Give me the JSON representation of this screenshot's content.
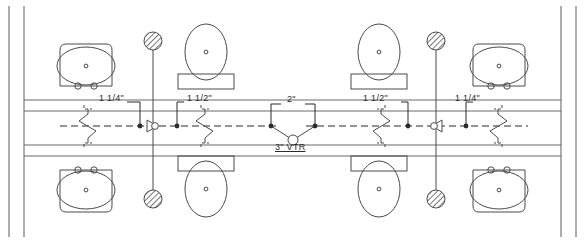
{
  "drawing": {
    "title": "Back-to-Back Restroom Drain, Waste and Vent Plan",
    "type": "plumbing-riser-plan",
    "background_color": "#ffffff",
    "line_color": "#4a4a4a",
    "dark_line_color": "#2b2b2b",
    "hatch_color": "#555555"
  },
  "labels": {
    "lav_left_size": "1 1/4\"",
    "wc_left_size": "1 1/2\"",
    "stack_size": "2\"",
    "vtr": "3\"  VTR",
    "wc_right_size": "1 1/2\"",
    "lav_right_size": "1 1/4\""
  },
  "fixtures": {
    "lavatory_upper_left": {
      "name": "lavatory",
      "position": "upper-left"
    },
    "water_closet_upper_left": {
      "name": "water-closet",
      "position": "upper-left-inner"
    },
    "water_closet_upper_right": {
      "name": "water-closet",
      "position": "upper-right-inner"
    },
    "lavatory_upper_right": {
      "name": "lavatory",
      "position": "upper-right"
    },
    "lavatory_lower_left": {
      "name": "lavatory",
      "position": "lower-left"
    },
    "water_closet_lower_left": {
      "name": "water-closet",
      "position": "lower-left-inner"
    },
    "water_closet_lower_right": {
      "name": "water-closet",
      "position": "lower-right-inner"
    },
    "lavatory_lower_right": {
      "name": "lavatory",
      "position": "lower-right"
    }
  },
  "cleanouts": [
    {
      "name": "cleanout-upper-left",
      "x": 153,
      "y": 41
    },
    {
      "name": "cleanout-lower-left",
      "x": 153,
      "y": 199
    },
    {
      "name": "cleanout-upper-right",
      "x": 436,
      "y": 41
    },
    {
      "name": "cleanout-lower-right",
      "x": 436,
      "y": 199
    }
  ],
  "vent_stack": {
    "name": "vent-through-roof",
    "size": "3\"",
    "x": 293,
    "y": 133
  }
}
